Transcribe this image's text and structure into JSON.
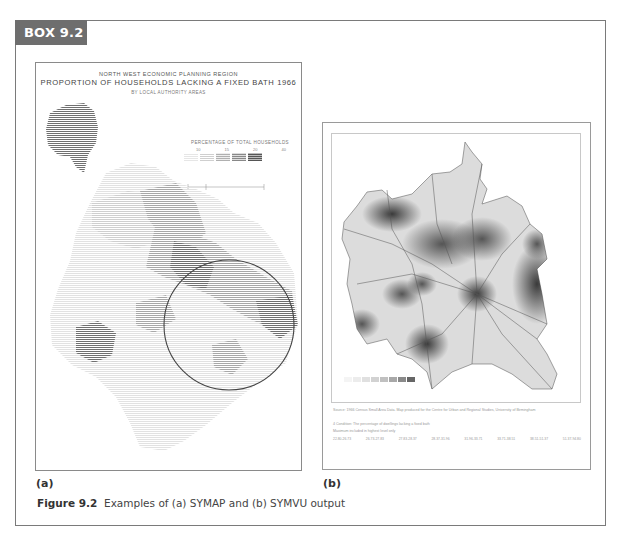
{
  "box": {
    "label": "BOX 9.2",
    "tab_color": "#6e6e6e",
    "border_color": "#7a7a7a"
  },
  "panel_a": {
    "label": "(a)",
    "title_line1": "NORTH WEST ECONOMIC PLANNING REGION",
    "title_line2": "PROPORTION OF HOUSEHOLDS LACKING A FIXED BATH 1966",
    "title_line3": "BY LOCAL AUTHORITY AREAS",
    "legend": {
      "title": "PERCENTAGE OF TOTAL HOUSEHOLDS",
      "ticks": [
        "10",
        "15",
        "20",
        "40"
      ],
      "shades": [
        "#f2f2f2",
        "#dcdcdc",
        "#c2c2c2",
        "#9a9a9a",
        "#6c6c6c"
      ]
    },
    "scale_bar": {
      "label_top": "KILOMETRES",
      "label_bottom": "MILES"
    }
  },
  "panel_b": {
    "label": "(b)",
    "source_text": "Source: 1966 Census Small Area Data. Map produced for the Centre for Urban and Regional Studies, University of Birmingham",
    "condition_text": "4 Condition: The percentage of dwellings lacking a fixed bath",
    "maximum_text": "Maximum included in highest level only",
    "class_ranges": [
      "22.80-26.73",
      "26.73-27.83",
      "27.83-28.37",
      "28.37-31.96",
      "31.96-33.71",
      "33.71-38.51",
      "38.51-51.37",
      "51.37-94.80"
    ],
    "legend_shades": [
      "#f4f4f4",
      "#ececec",
      "#e0e0e0",
      "#d2d2d2",
      "#c0c0c0",
      "#a8a8a8",
      "#8a8a8a",
      "#666666"
    ]
  },
  "caption": {
    "figure_label": "Figure 9.2",
    "text": "Examples of (a) SYMAP and (b) SYMVU output"
  }
}
